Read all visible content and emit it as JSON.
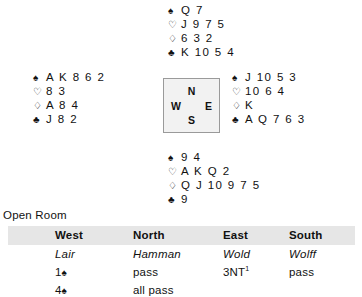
{
  "suits": {
    "spade": "♠",
    "heart": "♡",
    "diamond": "♢",
    "club": "♣"
  },
  "deal": {
    "north": {
      "seat": "North",
      "spades": "Q 7",
      "hearts": "J 9 7 5",
      "diamonds": "6 3 2",
      "clubs": "K 10 5 4"
    },
    "west": {
      "seat": "West",
      "spades": "A K 8 6 2",
      "hearts": "8 3",
      "diamonds": "A 8 4",
      "clubs": "J 8 2"
    },
    "east": {
      "seat": "East",
      "spades": "J 10 5 3",
      "hearts": "10 6 4",
      "diamonds": "K",
      "clubs": "A Q 7 6 3"
    },
    "south": {
      "seat": "South",
      "spades": "9 4",
      "hearts": "A K Q 2",
      "diamonds": "Q J 10 9 7 5",
      "clubs": "9"
    }
  },
  "compass": {
    "north": "N",
    "west": "W",
    "east": "E",
    "south": "S"
  },
  "auction": {
    "room_label": "Open Room",
    "headers": [
      "West",
      "North",
      "East",
      "South"
    ],
    "players": [
      "Lair",
      "Hamman",
      "Wold",
      "Wolff"
    ],
    "rows": [
      {
        "west_level": "1",
        "west_suit": "♠",
        "north": "pass",
        "east": "3NT",
        "east_note": "1",
        "south": "pass"
      },
      {
        "west_level": "4",
        "west_suit": "♠",
        "north": "all pass",
        "east": "",
        "east_note": "",
        "south": ""
      }
    ],
    "header_bg": "#e6e6e6"
  }
}
